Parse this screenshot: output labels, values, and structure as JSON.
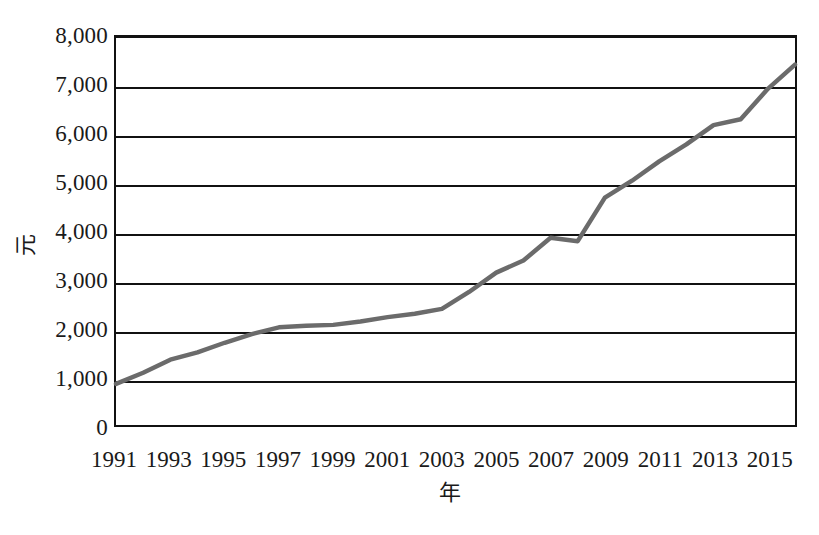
{
  "chart_data": {
    "type": "line",
    "title": "",
    "xlabel": "年",
    "ylabel": "元",
    "grid": true,
    "legend": false,
    "xlim": [
      1991,
      2016
    ],
    "ylim": [
      0,
      8000
    ],
    "ytick_labels": [
      "8,000",
      "7,000",
      "6,000",
      "5,000",
      "4,000",
      "3,000",
      "2,000",
      "1,000",
      "0"
    ],
    "ytick_values": [
      8000,
      7000,
      6000,
      5000,
      4000,
      3000,
      2000,
      1000,
      0
    ],
    "xtick_labels": [
      "1991",
      "1993",
      "1995",
      "1997",
      "1999",
      "2001",
      "2003",
      "2005",
      "2007",
      "2009",
      "2011",
      "2013",
      "2015"
    ],
    "xtick_values": [
      1991,
      1993,
      1995,
      1997,
      1999,
      2001,
      2003,
      2005,
      2007,
      2009,
      2011,
      2013,
      2015
    ],
    "line_color": "#6b6b6b",
    "axis_color": "#111111",
    "x": [
      1991,
      1992,
      1993,
      1994,
      1995,
      1996,
      1997,
      1998,
      1999,
      2000,
      2001,
      2002,
      2003,
      2004,
      2005,
      2006,
      2007,
      2008,
      2009,
      2010,
      2011,
      2012,
      2013,
      2014,
      2015,
      2016
    ],
    "values": [
      850,
      1080,
      1350,
      1500,
      1700,
      1880,
      2020,
      2050,
      2070,
      2140,
      2230,
      2300,
      2400,
      2750,
      3150,
      3400,
      3870,
      3800,
      4700,
      5050,
      5450,
      5800,
      6200,
      6320,
      6950,
      7450
    ],
    "series": [
      {
        "name": "元",
        "values": [
          850,
          1080,
          1350,
          1500,
          1700,
          1880,
          2020,
          2050,
          2070,
          2140,
          2230,
          2300,
          2400,
          2750,
          3150,
          3400,
          3870,
          3800,
          4700,
          5050,
          5450,
          5800,
          6200,
          6320,
          6950,
          7450
        ]
      }
    ]
  }
}
